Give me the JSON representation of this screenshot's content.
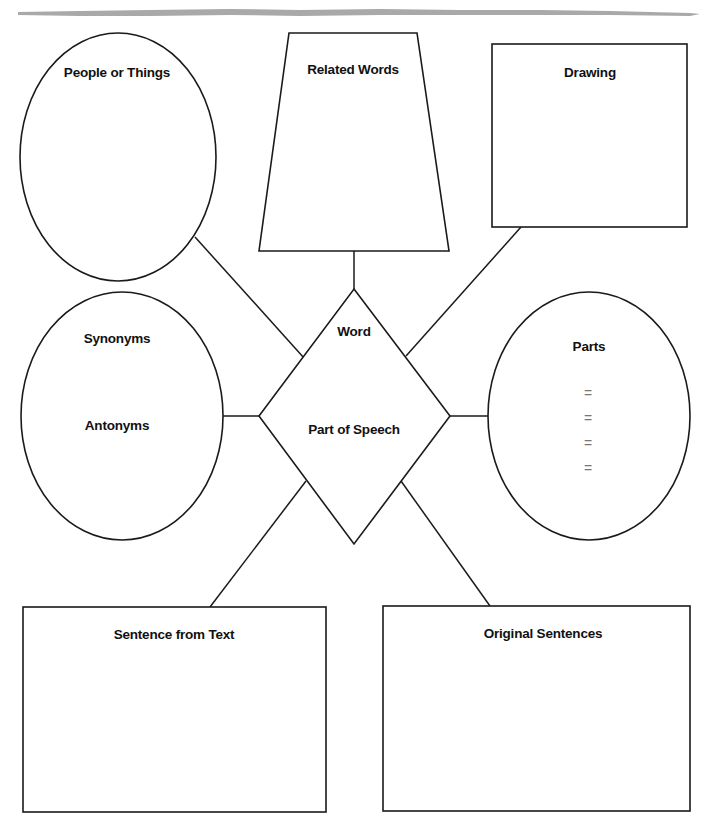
{
  "worksheet": {
    "type": "vocabulary graphic organizer",
    "center": {
      "word_label": "Word",
      "part_of_speech_label": "Part of Speech"
    },
    "nodes": {
      "people_or_things": {
        "label": "People or Things",
        "shape": "ellipse"
      },
      "related_words": {
        "label": "Related Words",
        "shape": "trapezoid"
      },
      "drawing": {
        "label": "Drawing",
        "shape": "rectangle"
      },
      "synonyms_antonyms": {
        "synonyms_label": "Synonyms",
        "antonyms_label": "Antonyms",
        "shape": "ellipse"
      },
      "parts": {
        "label": "Parts",
        "shape": "ellipse",
        "equations": [
          "=",
          "=",
          "=",
          "="
        ]
      },
      "sentence_from_text": {
        "label": "Sentence from Text",
        "shape": "rectangle"
      },
      "original_sentences": {
        "label": "Original Sentences",
        "shape": "rectangle"
      }
    }
  },
  "colors": {
    "stroke": "#1a1a1a",
    "text": "#111111",
    "equals_sign": "#777777",
    "torn_edge": "#a9a9a9",
    "background": "#ffffff"
  }
}
